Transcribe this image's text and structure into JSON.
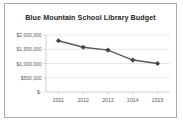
{
  "chart_data": {
    "type": "line",
    "title": "Blue Mountain School Library Budget",
    "xlabel": "",
    "ylabel": "",
    "categories": [
      "2011",
      "2012",
      "2013",
      "2014",
      "2015"
    ],
    "values": [
      1800000,
      1570000,
      1470000,
      1120000,
      1000000
    ],
    "series": [
      {
        "name": "Library Budget",
        "values": [
          1800000,
          1570000,
          1470000,
          1120000,
          1000000
        ]
      }
    ],
    "ylim": [
      0,
      2000000
    ],
    "ytick_values": [
      2000000,
      1500000,
      1000000,
      500000,
      0
    ],
    "ytick_labels": [
      "$2,000,000",
      "$1,500,000",
      "$1,000,000",
      "$500,000",
      "$-"
    ],
    "xtick_labels": [
      "2011",
      "2012",
      "2013",
      "2014",
      "2015"
    ],
    "grid": "horizontal",
    "legend": "none",
    "marker": "diamond",
    "colors": {
      "line": "#595959",
      "marker": "#404040",
      "gridline": "#d9d9d9",
      "axis": "#bfbfbf",
      "title_text": "#262626",
      "tick_text": "#595959",
      "background": "#ffffff",
      "border": "#aaaaaa"
    }
  }
}
